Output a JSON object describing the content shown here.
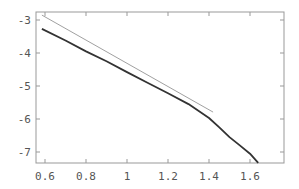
{
  "chart_data": {
    "type": "line",
    "title": "",
    "xlabel": "",
    "ylabel": "",
    "xlim": [
      0.585,
      1.78
    ],
    "ylim": [
      -7.45,
      -2.75
    ],
    "grid": false,
    "legend": null,
    "x_ticks": [
      0.6,
      0.8,
      1,
      1.2,
      1.4,
      1.6
    ],
    "x_tick_labels": [
      "0.6",
      "0.8",
      "1",
      "1.2",
      "1.4",
      "1.6"
    ],
    "y_ticks": [
      -3,
      -4,
      -5,
      -6,
      -7
    ],
    "y_tick_labels": [
      "-3",
      "-4",
      "-5",
      "-6",
      "-7"
    ],
    "series": [
      {
        "name": "reference-line",
        "style": "thin",
        "color": "#888888",
        "x": [
          0.585,
          1.42
        ],
        "y": [
          -2.85,
          -5.79
        ]
      },
      {
        "name": "data-curve",
        "style": "thick-jagged",
        "color": "#333333",
        "x": [
          0.585,
          0.7,
          0.8,
          0.9,
          1.0,
          1.1,
          1.2,
          1.3,
          1.4,
          1.45,
          1.5,
          1.55,
          1.6,
          1.64
        ],
        "y": [
          -3.27,
          -3.62,
          -3.95,
          -4.25,
          -4.58,
          -4.9,
          -5.22,
          -5.55,
          -5.97,
          -6.25,
          -6.55,
          -6.8,
          -7.05,
          -7.33
        ]
      }
    ]
  }
}
